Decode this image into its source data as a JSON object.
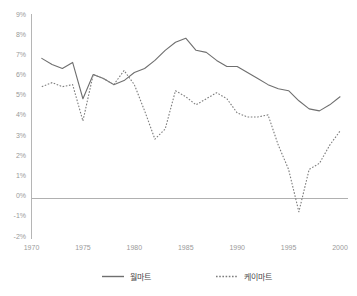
{
  "chart_data": {
    "type": "line",
    "title": "",
    "xlabel": "",
    "ylabel": "",
    "xlim": [
      1970,
      2000
    ],
    "ylim": [
      -2,
      9
    ],
    "grid": false,
    "legend_position": "bottom",
    "x_ticks": [
      "1970",
      "1975",
      "1980",
      "1985",
      "1990",
      "1995",
      "2000"
    ],
    "y_ticks": [
      "9%",
      "8%",
      "7%",
      "6%",
      "5%",
      "4%",
      "3%",
      "2%",
      "1%",
      "0%",
      "-1%",
      "-2%"
    ],
    "x": [
      1971,
      1972,
      1973,
      1974,
      1975,
      1976,
      1977,
      1978,
      1979,
      1980,
      1981,
      1982,
      1983,
      1984,
      1985,
      1986,
      1987,
      1988,
      1989,
      1990,
      1991,
      1992,
      1993,
      1994,
      1995,
      1996,
      1997,
      1998,
      1999,
      2000
    ],
    "series": [
      {
        "name": "월마트",
        "style": "solid",
        "color": "#6f6f6f",
        "values": [
          6.8,
          6.5,
          6.3,
          6.6,
          4.8,
          6.0,
          5.8,
          5.5,
          5.7,
          6.1,
          6.3,
          6.7,
          7.2,
          7.6,
          7.8,
          7.2,
          7.1,
          6.7,
          6.4,
          6.4,
          6.1,
          5.8,
          5.5,
          5.3,
          5.2,
          4.7,
          4.3,
          4.2,
          4.5,
          4.9
        ]
      },
      {
        "name": "케이마트",
        "style": "dotted",
        "color": "#7d7d7d",
        "values": [
          5.4,
          5.6,
          5.4,
          5.5,
          3.7,
          6.0,
          5.8,
          5.5,
          6.2,
          5.5,
          4.2,
          2.8,
          3.3,
          5.2,
          4.9,
          4.5,
          4.8,
          5.1,
          4.8,
          4.1,
          3.9,
          3.9,
          4.0,
          2.5,
          1.3,
          -0.8,
          1.3,
          1.6,
          2.5,
          3.2
        ]
      }
    ]
  },
  "legend": {
    "items": [
      {
        "label": "월마트",
        "style": "solid"
      },
      {
        "label": "케이마트",
        "style": "dotted"
      }
    ]
  }
}
